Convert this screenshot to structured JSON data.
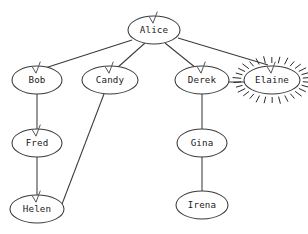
{
  "canvas": {
    "width": 308,
    "height": 234,
    "background": "#ffffff",
    "title_fragment": ""
  },
  "style": {
    "node_stroke": "#3a3a3a",
    "node_fill": "#ffffff",
    "edge_stroke": "#3a3a3a",
    "label_color": "#1a1a1a",
    "arrow_color": "#555555",
    "highlight_color": "#2b2b2b"
  },
  "graph": {
    "node_labels": {
      "alice": "Alice",
      "bob": "Bob",
      "candy": "Candy",
      "derek": "Derek",
      "elaine": "Elaine",
      "fred": "Fred",
      "helen": "Helen",
      "gina": "Gina",
      "irena": "Irena"
    },
    "nodes": [
      {
        "id": "alice",
        "label": "Alice",
        "cx": 154,
        "cy": 30,
        "rx": 26,
        "ry": 14,
        "arrow": true,
        "highlighted": false
      },
      {
        "id": "bob",
        "label": "Bob",
        "cx": 37,
        "cy": 80,
        "rx": 25,
        "ry": 14,
        "arrow": true,
        "highlighted": false
      },
      {
        "id": "candy",
        "label": "Candy",
        "cx": 110,
        "cy": 80,
        "rx": 28,
        "ry": 14,
        "arrow": true,
        "highlighted": false
      },
      {
        "id": "derek",
        "label": "Derek",
        "cx": 202,
        "cy": 80,
        "rx": 27,
        "ry": 14,
        "arrow": true,
        "highlighted": false
      },
      {
        "id": "elaine",
        "label": "Elaine",
        "cx": 272,
        "cy": 80,
        "rx": 28,
        "ry": 14,
        "arrow": true,
        "highlighted": true
      },
      {
        "id": "fred",
        "label": "Fred",
        "cx": 37,
        "cy": 143,
        "rx": 25,
        "ry": 14,
        "arrow": true,
        "highlighted": false
      },
      {
        "id": "helen",
        "label": "Helen",
        "cx": 37,
        "cy": 209,
        "rx": 27,
        "ry": 14,
        "arrow": true,
        "highlighted": false
      },
      {
        "id": "gina",
        "label": "Gina",
        "cx": 202,
        "cy": 143,
        "rx": 25,
        "ry": 14,
        "arrow": false,
        "highlighted": false
      },
      {
        "id": "irena",
        "label": "Irena",
        "cx": 202,
        "cy": 205,
        "rx": 26,
        "ry": 14,
        "arrow": false,
        "highlighted": false
      }
    ],
    "edges": [
      {
        "id": "alice-bob",
        "from": "alice",
        "to": "bob",
        "x1": 132,
        "y1": 40,
        "x2": 45,
        "y2": 68,
        "directed": true
      },
      {
        "id": "alice-candy",
        "from": "alice",
        "to": "candy",
        "x1": 145,
        "y1": 43,
        "x2": 117,
        "y2": 68,
        "directed": true
      },
      {
        "id": "alice-derek",
        "from": "alice",
        "to": "derek",
        "x1": 165,
        "y1": 43,
        "x2": 196,
        "y2": 68,
        "directed": true
      },
      {
        "id": "alice-elaine",
        "from": "alice",
        "to": "elaine",
        "x1": 178,
        "y1": 38,
        "x2": 268,
        "y2": 65,
        "directed": true
      },
      {
        "id": "bob-fred",
        "from": "bob",
        "to": "fred",
        "x1": 37,
        "y1": 94,
        "x2": 37,
        "y2": 131,
        "directed": true
      },
      {
        "id": "fred-helen",
        "from": "fred",
        "to": "helen",
        "x1": 37,
        "y1": 157,
        "x2": 37,
        "y2": 196,
        "directed": true
      },
      {
        "id": "candy-helen",
        "from": "candy",
        "to": "helen",
        "x1": 104,
        "y1": 94,
        "x2": 59,
        "y2": 212,
        "directed": false
      },
      {
        "id": "derek-gina",
        "from": "derek",
        "to": "gina",
        "x1": 202,
        "y1": 94,
        "x2": 202,
        "y2": 129,
        "directed": false
      },
      {
        "id": "gina-irena",
        "from": "gina",
        "to": "irena",
        "x1": 202,
        "y1": 157,
        "x2": 202,
        "y2": 191,
        "directed": false
      },
      {
        "id": "derek-elaine",
        "from": "derek",
        "to": "elaine",
        "x1": 229,
        "y1": 82,
        "x2": 244,
        "y2": 82,
        "directed": false
      }
    ],
    "highlight": {
      "node": "elaine",
      "ray_count": 30,
      "inner_offset": 3,
      "ray_length": 7
    }
  }
}
